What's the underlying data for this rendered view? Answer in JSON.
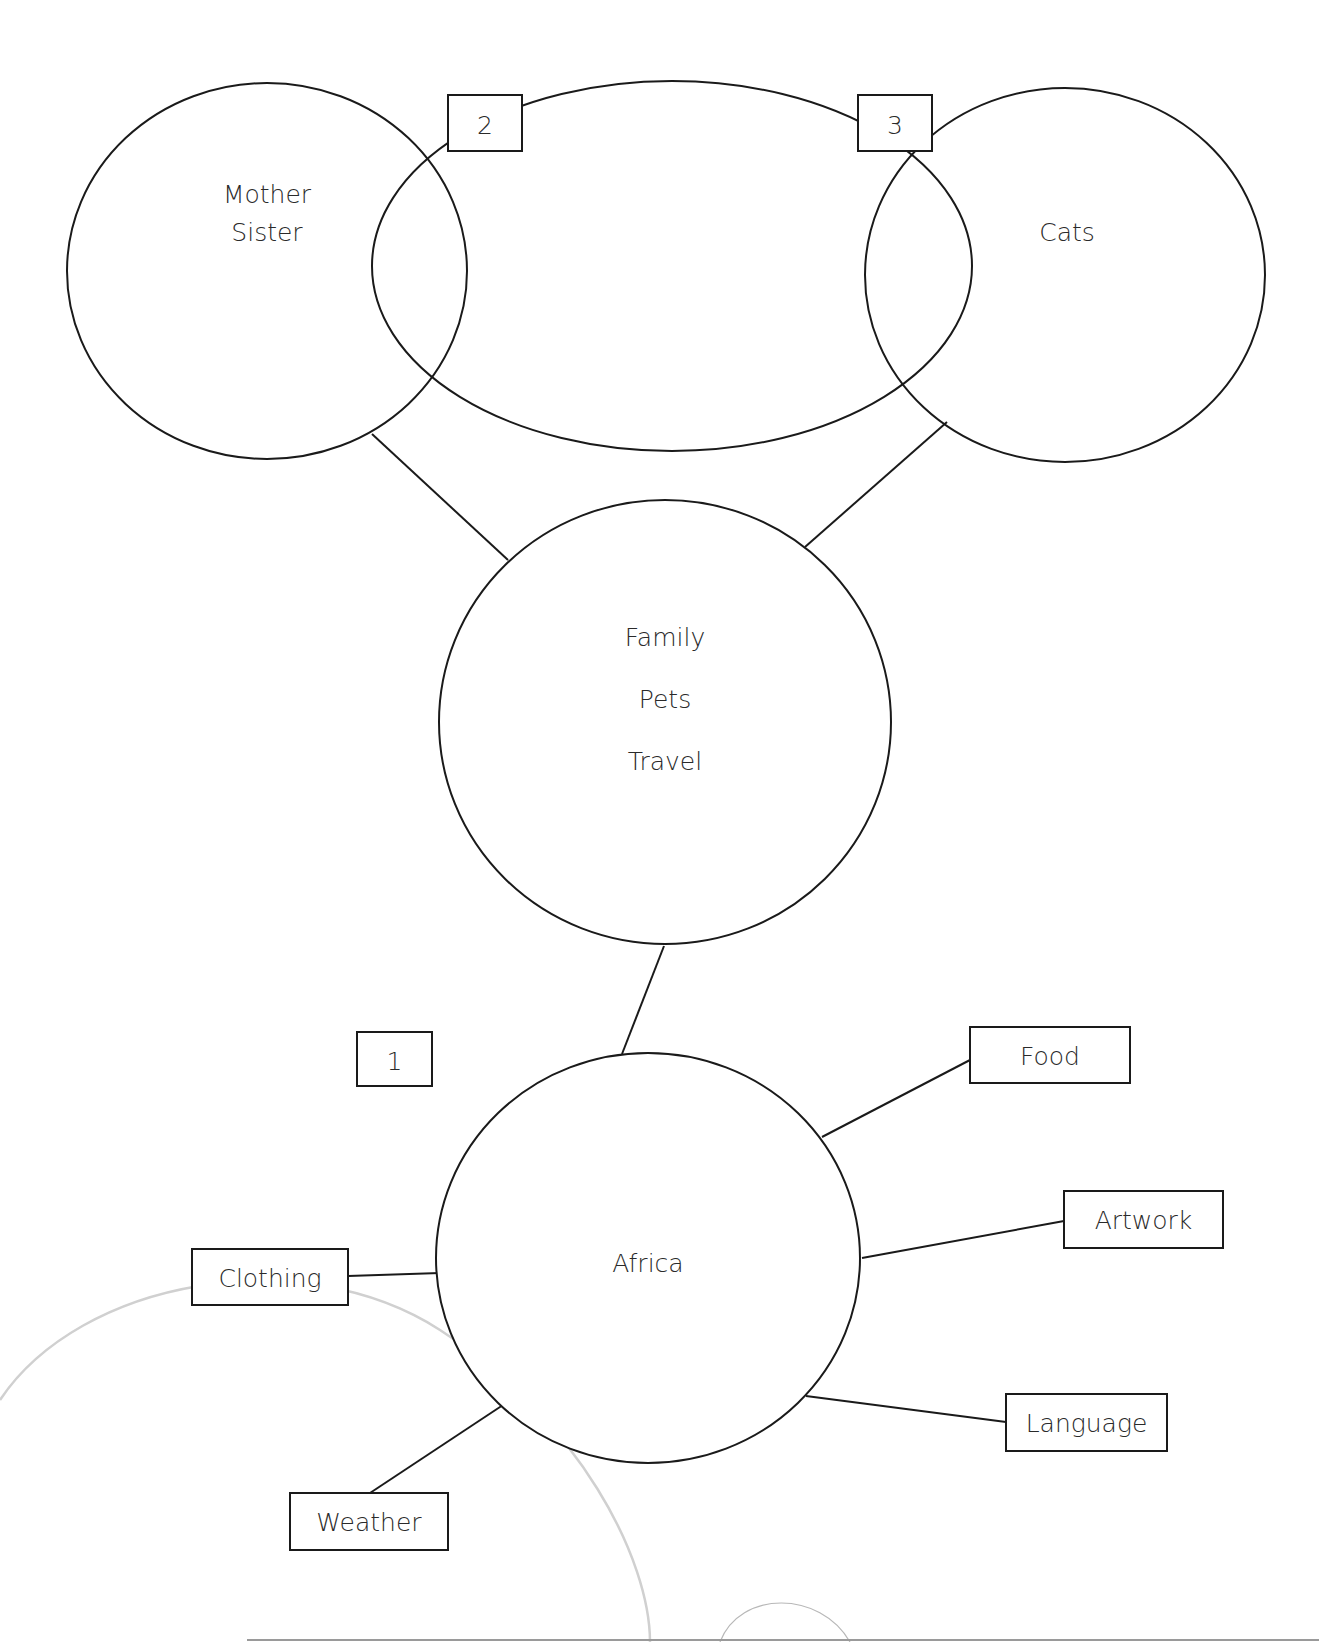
{
  "colors": {
    "stroke": "#1a1a1a",
    "text": "#2a2a2a",
    "background": "#ffffff",
    "faint_arc": "#d0d0d0"
  },
  "ellipses": [
    {
      "id": "mother-sister",
      "cx": 267,
      "cy": 271,
      "rx": 200,
      "ry": 188,
      "lines": [
        "Mother",
        "Sister"
      ],
      "text_x": 267,
      "text_y": [
        194,
        232
      ]
    },
    {
      "id": "middle-oval",
      "cx": 672,
      "cy": 266,
      "rx": 300,
      "ry": 185,
      "lines": [],
      "text_x": 672,
      "text_y": []
    },
    {
      "id": "cats",
      "cx": 1065,
      "cy": 275,
      "rx": 200,
      "ry": 187,
      "lines": [
        "Cats"
      ],
      "text_x": 1067,
      "text_y": [
        232
      ]
    },
    {
      "id": "family-pets-travel",
      "cx": 665,
      "cy": 722,
      "rx": 226,
      "ry": 222,
      "lines": [
        "Family",
        "Pets",
        "Travel"
      ],
      "text_x": 665,
      "text_y": [
        637,
        699,
        761
      ]
    },
    {
      "id": "africa",
      "cx": 648,
      "cy": 1258,
      "rx": 212,
      "ry": 205,
      "lines": [
        "Africa"
      ],
      "text_x": 648,
      "text_y": [
        1263
      ]
    }
  ],
  "number_boxes": [
    {
      "id": "box-2",
      "label": "2",
      "x": 448,
      "y": 95,
      "w": 74,
      "h": 56
    },
    {
      "id": "box-3",
      "label": "3",
      "x": 858,
      "y": 95,
      "w": 74,
      "h": 56
    },
    {
      "id": "box-1",
      "label": "1",
      "x": 357,
      "y": 1032,
      "w": 75,
      "h": 54
    }
  ],
  "topic_boxes": [
    {
      "id": "food",
      "label": "Food",
      "x": 970,
      "y": 1027,
      "w": 160,
      "h": 56
    },
    {
      "id": "artwork",
      "label": "Artwork",
      "x": 1064,
      "y": 1191,
      "w": 159,
      "h": 57
    },
    {
      "id": "clothing",
      "label": "Clothing",
      "x": 192,
      "y": 1249,
      "w": 156,
      "h": 56
    },
    {
      "id": "language",
      "label": "Language",
      "x": 1006,
      "y": 1394,
      "w": 161,
      "h": 57
    },
    {
      "id": "weather",
      "label": "Weather",
      "x": 290,
      "y": 1493,
      "w": 158,
      "h": 57
    }
  ],
  "connectors": [
    {
      "id": "mother-to-family",
      "x1": 372,
      "y1": 434,
      "x2": 508,
      "y2": 560
    },
    {
      "id": "cats-to-family",
      "x1": 947,
      "y1": 422,
      "x2": 805,
      "y2": 547
    },
    {
      "id": "family-to-africa",
      "x1": 664,
      "y1": 946,
      "x2": 622,
      "y2": 1054
    },
    {
      "id": "africa-to-food",
      "x1": 822,
      "y1": 1137,
      "x2": 970,
      "y2": 1060
    },
    {
      "id": "africa-to-artwork",
      "x1": 862,
      "y1": 1258,
      "x2": 1064,
      "y2": 1221
    },
    {
      "id": "africa-to-clothing",
      "x1": 348,
      "y1": 1276,
      "x2": 440,
      "y2": 1273
    },
    {
      "id": "africa-to-language",
      "x1": 806,
      "y1": 1396,
      "x2": 1006,
      "y2": 1422
    },
    {
      "id": "africa-to-weather",
      "x1": 503,
      "y1": 1405,
      "x2": 370,
      "y2": 1493
    }
  ],
  "answers": {
    "box_1": "",
    "box_2": "",
    "box_3": ""
  }
}
